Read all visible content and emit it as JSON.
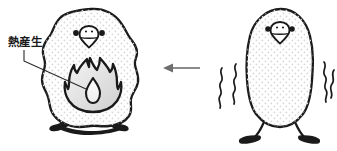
{
  "illustration": {
    "title": "熱産生",
    "type": "scientific-diagram",
    "background_color": "#ffffff",
    "ink_color": "#1a1a1a",
    "fill_color": "#ffffff",
    "texture": "halftone-dots",
    "texture_color": "#d8d8d8",
    "arrow_color": "#6e6e6e"
  },
  "annotation": {
    "label": "熱産生",
    "label_romaji": "netsu-sansei",
    "leader_line": "vertical-then-diagonal-to-flame"
  },
  "left_bird": {
    "name": "fluffed-bird",
    "state": "puffed-up",
    "body_shape": "round-fluffy-bumpy-outline",
    "legs": "short-tucked",
    "eyes": 2,
    "beak": "rounded-triangular",
    "flame": {
      "name": "heat-production-flame",
      "outer_fill": "#e2e2e2",
      "inner_fill": "#f2f2f2",
      "outline": "#1a1a1a"
    }
  },
  "right_bird": {
    "name": "shivering-bird",
    "state": "slim-shivering",
    "body_shape": "smooth-egg-pear",
    "legs": "long-thin-splayed-feet",
    "eyes": 2,
    "beak": "rounded-triangular",
    "shiver_lines": {
      "name": "shiver-squiggles",
      "left_count": 2,
      "right_count": 2
    }
  },
  "arrow": {
    "name": "transition-arrow",
    "direction": "left",
    "meaning": "shivering bird becomes fluffed bird producing heat",
    "color": "#6e6e6e"
  }
}
